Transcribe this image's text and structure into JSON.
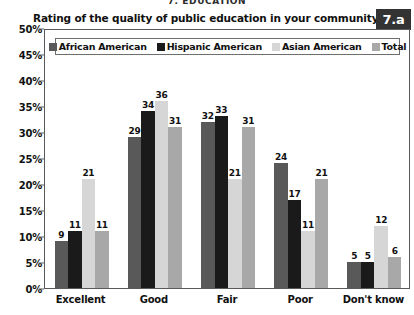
{
  "section_header": "7. EDUCATION",
  "badge": {
    "label": "7.a"
  },
  "chart_data": {
    "type": "bar",
    "title": "Rating of the quality of public education in your community?",
    "xlabel": "",
    "ylabel": "",
    "ylim": [
      0,
      50
    ],
    "ytick_labels": [
      "0%",
      "5%",
      "10%",
      "15%",
      "20%",
      "25%",
      "30%",
      "35%",
      "40%",
      "45%",
      "50%"
    ],
    "ytick_values": [
      0,
      5,
      10,
      15,
      20,
      25,
      30,
      35,
      40,
      45,
      50
    ],
    "grid": false,
    "legend_position": "top-inside",
    "categories": [
      "Excellent",
      "Good",
      "Fair",
      "Poor",
      "Don't know"
    ],
    "series": [
      {
        "name": "African American",
        "color": "#595959",
        "values": [
          9,
          29,
          32,
          24,
          5
        ]
      },
      {
        "name": "Hispanic American",
        "color": "#1a1a1a",
        "values": [
          11,
          34,
          33,
          17,
          5
        ]
      },
      {
        "name": "Asian American",
        "color": "#d6d6d6",
        "values": [
          21,
          36,
          21,
          11,
          12
        ]
      },
      {
        "name": "Total",
        "color": "#a8a8a8",
        "values": [
          11,
          31,
          31,
          21,
          6
        ]
      }
    ]
  },
  "colors": {
    "african_american": "#595959",
    "hispanic_american": "#1a1a1a",
    "asian_american": "#d6d6d6",
    "total": "#a8a8a8",
    "axis": "#5a5a5a",
    "badge_bg": "#333333",
    "text": "#111111"
  }
}
